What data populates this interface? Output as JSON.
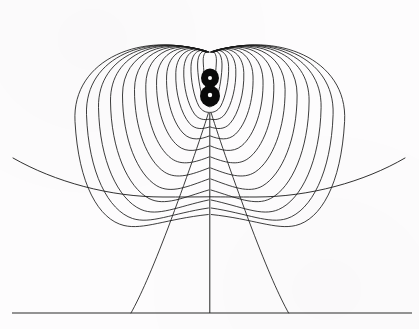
{
  "figure": {
    "caption": "",
    "background_color": "#fdfcfd",
    "line_color": "#1a1a1a",
    "width": 419,
    "height": 329
  },
  "chart_data": {
    "type": "line",
    "subtitle": "",
    "xlabel": "",
    "ylabel": "",
    "xlim": [
      0,
      419
    ],
    "ylim": [
      0,
      329
    ],
    "grid": false,
    "legend": null,
    "annotations": [],
    "tick_labels": {
      "x": [],
      "y": []
    },
    "geometry": {
      "center_x": 210,
      "dipole_axis_x": 210,
      "ground_line_y": 313,
      "ground_line_x_start": 12,
      "ground_line_x_end": 412,
      "upper_pole": {
        "x": 210,
        "y": 78,
        "radius": 2.0
      },
      "lower_pole": {
        "x": 210,
        "y": 95,
        "radius": 2.2
      },
      "convergence_top_y": 52,
      "convergence_bottom_y": 112
    },
    "series": [
      {
        "name": "dipole-loops-left",
        "count": 14,
        "description": "Nested closed loops from the upper cusp sweeping left and returning to the lower pole",
        "loop_half_widths": [
          6,
          11,
          17,
          23,
          30,
          38,
          47,
          57,
          68,
          80,
          92,
          104,
          118,
          132
        ],
        "loop_top_y": [
          50,
          46,
          42,
          38,
          34,
          30,
          27,
          24,
          22,
          20,
          18,
          17,
          16,
          15
        ],
        "loop_bottom_y": [
          101,
          106,
          112,
          119,
          127,
          136,
          146,
          157,
          168,
          179,
          190,
          200,
          208,
          214
        ]
      },
      {
        "name": "dipole-loops-right",
        "count": 14,
        "description": "Mirror image of the left loop family about the vertical dipole axis",
        "loop_half_widths": [
          6,
          11,
          17,
          23,
          30,
          38,
          47,
          57,
          68,
          80,
          92,
          104,
          118,
          132
        ],
        "loop_top_y": [
          50,
          46,
          42,
          38,
          34,
          30,
          27,
          24,
          22,
          20,
          18,
          17,
          16,
          15
        ],
        "loop_bottom_y": [
          101,
          106,
          112,
          119,
          127,
          136,
          146,
          157,
          168,
          179,
          190,
          200,
          208,
          214
        ]
      },
      {
        "name": "outer-sweep",
        "count": 1,
        "description": "Outermost open arc running from the left edge, dipping below the dipole, up to the right edge",
        "start": [
          13,
          158
        ],
        "lowest": [
          210,
          197
        ],
        "end": [
          405,
          158
        ]
      },
      {
        "name": "descending-lines",
        "count": 3,
        "description": "Field lines descending from the lower pole to the ground plane",
        "ground_intersections_x": [
          130,
          210,
          290
        ]
      }
    ],
    "values": {
      "loop_count_per_side": 14,
      "pole_count": 2,
      "ground_intersection_count": 3
    }
  }
}
